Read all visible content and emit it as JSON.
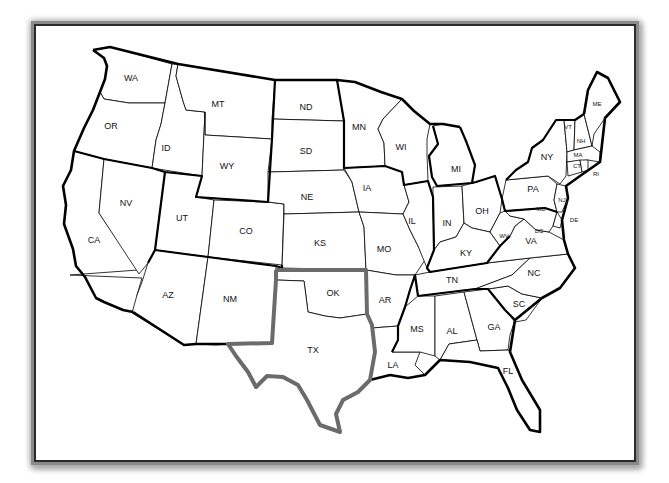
{
  "map": {
    "title": "United States map",
    "highlight_color": "#6b6b6b",
    "highlighted_states": [
      "TX",
      "OK"
    ],
    "states": [
      {
        "abbr": "WA",
        "x": 131,
        "y": 81
      },
      {
        "abbr": "OR",
        "x": 111,
        "y": 129
      },
      {
        "abbr": "ID",
        "x": 166,
        "y": 151
      },
      {
        "abbr": "MT",
        "x": 218,
        "y": 107
      },
      {
        "abbr": "WY",
        "x": 227,
        "y": 169
      },
      {
        "abbr": "ND",
        "x": 306,
        "y": 110
      },
      {
        "abbr": "SD",
        "x": 306,
        "y": 154
      },
      {
        "abbr": "NE",
        "x": 307,
        "y": 200
      },
      {
        "abbr": "KS",
        "x": 320,
        "y": 246
      },
      {
        "abbr": "MN",
        "x": 359,
        "y": 130
      },
      {
        "abbr": "IA",
        "x": 367,
        "y": 191
      },
      {
        "abbr": "MO",
        "x": 384,
        "y": 252
      },
      {
        "abbr": "WI",
        "x": 401,
        "y": 150
      },
      {
        "abbr": "IL",
        "x": 412,
        "y": 224
      },
      {
        "abbr": "MI",
        "x": 456,
        "y": 172
      },
      {
        "abbr": "IN",
        "x": 447,
        "y": 226
      },
      {
        "abbr": "OH",
        "x": 482,
        "y": 214
      },
      {
        "abbr": "KY",
        "x": 466,
        "y": 256
      },
      {
        "abbr": "TN",
        "x": 452,
        "y": 283
      },
      {
        "abbr": "WV",
        "x": 504,
        "y": 238
      },
      {
        "abbr": "VA",
        "x": 531,
        "y": 244
      },
      {
        "abbr": "NC",
        "x": 534,
        "y": 276
      },
      {
        "abbr": "SC",
        "x": 519,
        "y": 307
      },
      {
        "abbr": "GA",
        "x": 494,
        "y": 330
      },
      {
        "abbr": "AL",
        "x": 452,
        "y": 334
      },
      {
        "abbr": "MS",
        "x": 417,
        "y": 332
      },
      {
        "abbr": "FL",
        "x": 508,
        "y": 374
      },
      {
        "abbr": "LA",
        "x": 393,
        "y": 368
      },
      {
        "abbr": "AR",
        "x": 385,
        "y": 303
      },
      {
        "abbr": "OK",
        "x": 333,
        "y": 296
      },
      {
        "abbr": "TX",
        "x": 313,
        "y": 353
      },
      {
        "abbr": "NM",
        "x": 230,
        "y": 302
      },
      {
        "abbr": "AZ",
        "x": 168,
        "y": 298
      },
      {
        "abbr": "CO",
        "x": 246,
        "y": 234
      },
      {
        "abbr": "UT",
        "x": 182,
        "y": 221
      },
      {
        "abbr": "NV",
        "x": 126,
        "y": 206
      },
      {
        "abbr": "CA",
        "x": 94,
        "y": 243
      },
      {
        "abbr": "PA",
        "x": 533,
        "y": 192
      },
      {
        "abbr": "NY",
        "x": 547,
        "y": 160
      },
      {
        "abbr": "VT",
        "x": 568,
        "y": 129
      },
      {
        "abbr": "NH",
        "x": 581,
        "y": 143
      },
      {
        "abbr": "ME",
        "x": 597,
        "y": 106
      },
      {
        "abbr": "MA",
        "x": 578,
        "y": 157
      },
      {
        "abbr": "CT",
        "x": 577,
        "y": 168
      },
      {
        "abbr": "RI",
        "x": 596,
        "y": 176
      },
      {
        "abbr": "NJ",
        "x": 562,
        "y": 202
      },
      {
        "abbr": "DE",
        "x": 574,
        "y": 222
      },
      {
        "abbr": "MD",
        "x": 541,
        "y": 211
      },
      {
        "abbr": "DC",
        "x": 539,
        "y": 233
      }
    ]
  }
}
